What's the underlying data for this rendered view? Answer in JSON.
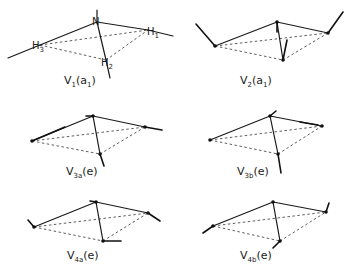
{
  "diagram": {
    "atoms": {
      "central": "N",
      "ligands": [
        "H1",
        "H2",
        "H3"
      ]
    },
    "modes": [
      {
        "id": "v1",
        "symbol": "V",
        "subscript": "1",
        "symmetry": "a",
        "sym_sub": "1",
        "caption_open": "(",
        "caption_close": ")"
      },
      {
        "id": "v2",
        "symbol": "V",
        "subscript": "2",
        "symmetry": "a",
        "sym_sub": "1",
        "caption_open": "(",
        "caption_close": ")"
      },
      {
        "id": "v3a",
        "symbol": "V",
        "subscript": "3a",
        "symmetry": "e",
        "sym_sub": "",
        "caption_open": "(",
        "caption_close": ")"
      },
      {
        "id": "v3b",
        "symbol": "V",
        "subscript": "3b",
        "symmetry": "e",
        "sym_sub": "",
        "caption_open": "(",
        "caption_close": ")"
      },
      {
        "id": "v4a",
        "symbol": "V",
        "subscript": "4a",
        "symmetry": "e",
        "sym_sub": "",
        "caption_open": "(",
        "caption_close": ")"
      },
      {
        "id": "v4b",
        "symbol": "V",
        "subscript": "4b",
        "symmetry": "e",
        "sym_sub": "",
        "caption_open": "(",
        "caption_close": ")"
      }
    ],
    "atom_labels": {
      "n": "N",
      "h1": "H",
      "h1_sub": "1",
      "h2": "H",
      "h2_sub": "2",
      "h3": "H",
      "h3_sub": "3"
    }
  }
}
